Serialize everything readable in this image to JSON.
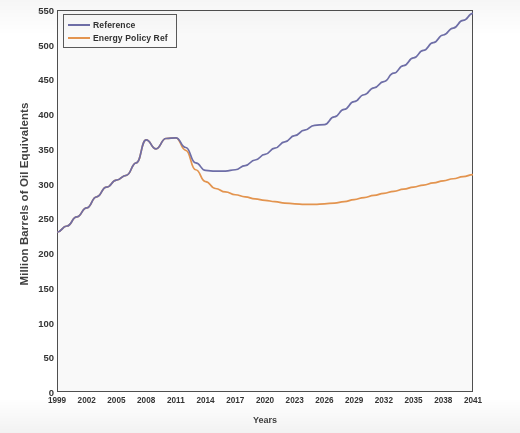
{
  "chart_data": {
    "type": "line",
    "title": "",
    "xlabel": "Years",
    "ylabel": "Million Barrels of Oil Equivalents",
    "xlim": [
      1999,
      2041
    ],
    "ylim": [
      0,
      550
    ],
    "grid": false,
    "legend_position": "upper-left",
    "y_ticks": [
      0,
      50,
      100,
      150,
      200,
      250,
      300,
      350,
      400,
      450,
      500,
      550
    ],
    "x_ticks": [
      1999,
      2002,
      2005,
      2008,
      2011,
      2014,
      2017,
      2020,
      2023,
      2026,
      2029,
      2032,
      2035,
      2038,
      2041
    ],
    "x_tick_labels": [
      "1999",
      "2002",
      "2005",
      "2008",
      "2011",
      "2014",
      "2017",
      "2020",
      "2023",
      "2026",
      "2029",
      "2032",
      "2035",
      "2038",
      "2041"
    ],
    "x": [
      1999,
      2000,
      2001,
      2002,
      2003,
      2004,
      2005,
      2006,
      2007,
      2008,
      2009,
      2010,
      2011,
      2012,
      2013,
      2014,
      2015,
      2016,
      2017,
      2018,
      2019,
      2020,
      2021,
      2022,
      2023,
      2024,
      2025,
      2026,
      2027,
      2028,
      2029,
      2030,
      2031,
      2032,
      2033,
      2034,
      2035,
      2036,
      2037,
      2038,
      2039,
      2040,
      2041
    ],
    "series": [
      {
        "name": "Reference",
        "color": "#6B6BA8",
        "values": [
          230,
          239,
          252,
          265,
          281,
          295,
          305,
          312,
          330,
          363,
          350,
          365,
          366,
          352,
          330,
          319,
          318,
          318,
          320,
          326,
          334,
          342,
          351,
          360,
          369,
          377,
          384,
          385,
          396,
          407,
          418,
          428,
          438,
          447,
          459,
          470,
          481,
          492,
          503,
          514,
          524,
          535,
          545
        ]
      },
      {
        "name": "Energy Policy Ref",
        "color": "#E8944A",
        "values": [
          230,
          239,
          252,
          265,
          281,
          295,
          305,
          312,
          330,
          363,
          350,
          365,
          366,
          348,
          320,
          303,
          293,
          288,
          284,
          281,
          278,
          276,
          274,
          272,
          271,
          270,
          270,
          271,
          272,
          274,
          277,
          280,
          283,
          286,
          289,
          292,
          295,
          298,
          301,
          304,
          307,
          310,
          313
        ]
      }
    ]
  },
  "legend": {
    "items": [
      {
        "label": "Reference",
        "color": "#6B6BA8"
      },
      {
        "label": "Energy Policy Ref",
        "color": "#E8944A"
      }
    ]
  }
}
